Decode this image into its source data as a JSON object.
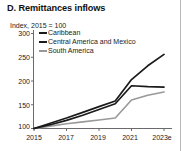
{
  "title": "D. Remittances inflows",
  "subtitle": "Index, 2015 = 100",
  "colors": {
    "caribbean": "#1a1a1a",
    "central_america": "#1a1a1a",
    "south_america": "#999999",
    "axis": "#555555",
    "text": "#1a1a1a"
  },
  "legend": [
    {
      "label": "Caribbean",
      "color": "#1a1a1a"
    },
    {
      "label": "Central America and Mexico",
      "color": "#1a1a1a"
    },
    {
      "label": "South America",
      "color": "#999999"
    }
  ],
  "chart_data": {
    "type": "line",
    "title": "D. Remittances inflows",
    "subtitle": "Index, 2015 = 100",
    "xlabel": "",
    "ylabel": "Index, 2015 = 100",
    "x": [
      2015,
      2016,
      2017,
      2018,
      2019,
      2020,
      2021,
      2022,
      2023
    ],
    "xtick_labels": [
      "2015",
      "2017",
      "2019",
      "2021",
      "2023e"
    ],
    "xticks": [
      2015,
      2017,
      2019,
      2021,
      2023
    ],
    "ytick_labels": [
      "100",
      "150",
      "200",
      "250",
      "300"
    ],
    "yticks": [
      100,
      150,
      200,
      250,
      300
    ],
    "ylim": [
      100,
      300
    ],
    "xlim": [
      2015,
      2023
    ],
    "grid": false,
    "legend_position": "top-left",
    "series": [
      {
        "name": "Caribbean",
        "color": "#1a1a1a",
        "values": [
          100,
          111,
          122,
          134,
          146,
          158,
          203,
          232,
          256
        ]
      },
      {
        "name": "Central America and Mexico",
        "color": "#1a1a1a",
        "values": [
          100,
          108,
          117,
          128,
          140,
          152,
          190,
          188,
          187
        ]
      },
      {
        "name": "South America",
        "color": "#999999",
        "values": [
          100,
          105,
          110,
          114,
          118,
          122,
          160,
          170,
          177
        ]
      }
    ]
  }
}
